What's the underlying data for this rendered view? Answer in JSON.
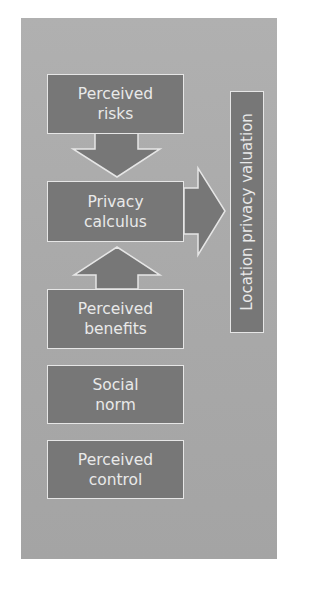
{
  "colors": {
    "background": "#ffffff",
    "panel": "#ababab",
    "box_fill": "#777777",
    "box_border": "#e6e6e6",
    "text": "#e9e9e9"
  },
  "diagram": {
    "nodes": [
      {
        "id": "perceived-risks",
        "lines": [
          "Perceived",
          "risks"
        ]
      },
      {
        "id": "privacy-calculus",
        "lines": [
          "Privacy",
          "calculus"
        ]
      },
      {
        "id": "perceived-benefits",
        "lines": [
          "Perceived",
          "benefits"
        ]
      },
      {
        "id": "social-norm",
        "lines": [
          "Social",
          "norm"
        ]
      },
      {
        "id": "perceived-control",
        "lines": [
          "Perceived",
          "control"
        ]
      }
    ],
    "outcome": {
      "id": "location-privacy-valuation",
      "label": "Location privacy valuation"
    },
    "edges": [
      {
        "from": "perceived-risks",
        "to": "privacy-calculus",
        "direction": "down"
      },
      {
        "from": "perceived-benefits",
        "to": "privacy-calculus",
        "direction": "up"
      },
      {
        "from": "privacy-calculus",
        "to": "location-privacy-valuation",
        "direction": "right"
      }
    ]
  }
}
